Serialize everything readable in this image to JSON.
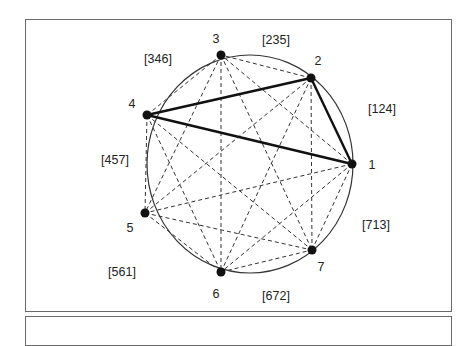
{
  "figure": {
    "type": "complete-graph-on-circle",
    "circle": {
      "cx": 250,
      "cy": 164,
      "rx": 103,
      "ry": 109
    },
    "nodes": [
      {
        "id": "1",
        "label": "1",
        "x": 352,
        "y": 164,
        "lx": 372,
        "ly": 165
      },
      {
        "id": "2",
        "label": "2",
        "x": 311,
        "y": 78,
        "lx": 318,
        "ly": 61
      },
      {
        "id": "3",
        "label": "3",
        "x": 221,
        "y": 55,
        "lx": 216,
        "ly": 39
      },
      {
        "id": "4",
        "label": "4",
        "x": 147,
        "y": 115,
        "lx": 132,
        "ly": 104
      },
      {
        "id": "5",
        "label": "5",
        "x": 145,
        "y": 213,
        "lx": 130,
        "ly": 228
      },
      {
        "id": "6",
        "label": "6",
        "x": 221,
        "y": 272,
        "lx": 216,
        "ly": 294
      },
      {
        "id": "7",
        "label": "7",
        "x": 312,
        "y": 250,
        "lx": 321,
        "ly": 267
      }
    ],
    "solid_edges": [
      [
        "4",
        "2"
      ],
      [
        "2",
        "1"
      ],
      [
        "4",
        "1"
      ]
    ],
    "dashed_edges": "all pairs",
    "arc_labels": [
      {
        "text": "[124]",
        "x": 382,
        "y": 109
      },
      {
        "text": "[235]",
        "x": 276,
        "y": 40
      },
      {
        "text": "[346]",
        "x": 158,
        "y": 59
      },
      {
        "text": "[457]",
        "x": 115,
        "y": 160
      },
      {
        "text": "[561]",
        "x": 122,
        "y": 272
      },
      {
        "text": "[672]",
        "x": 276,
        "y": 296
      },
      {
        "text": "[713]",
        "x": 376,
        "y": 225
      }
    ]
  }
}
